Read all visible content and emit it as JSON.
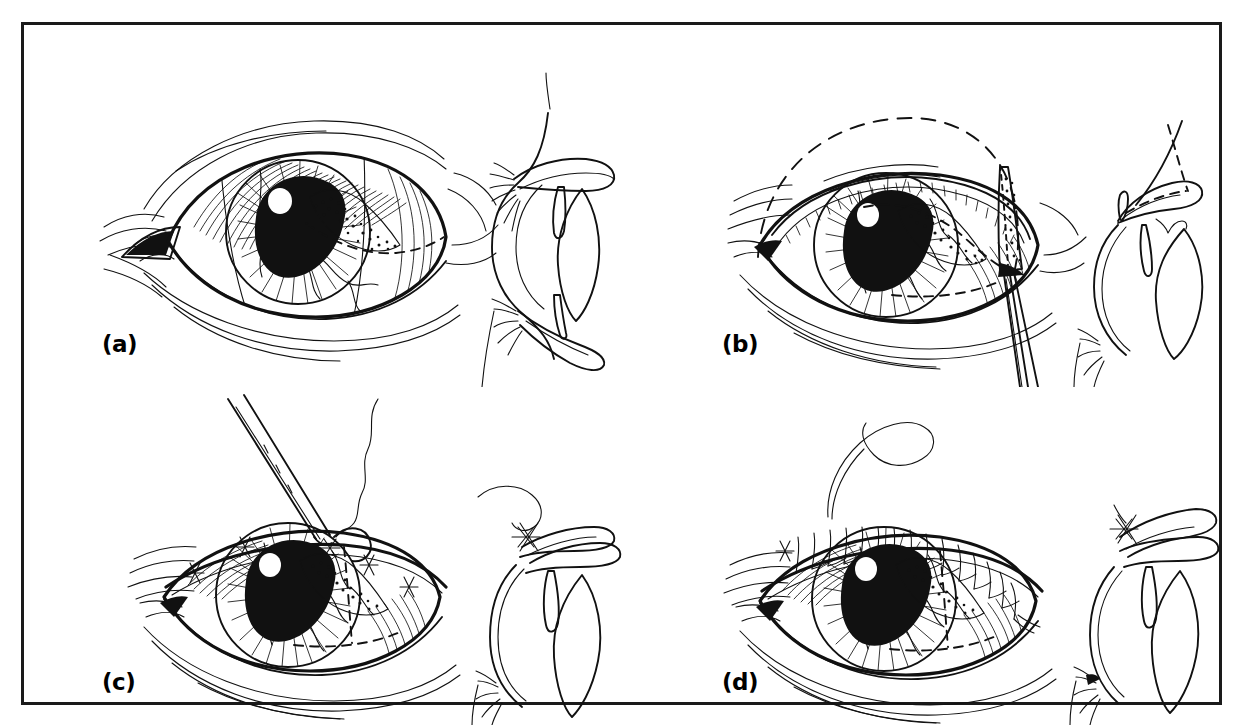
{
  "figure": {
    "kind": "surgical-technique-line-drawing",
    "background_color": "#ffffff",
    "ink_color": "#111111",
    "border_color": "#1a1a1a",
    "panel_count": 4,
    "panels": [
      {
        "id": "a",
        "label": "(a)",
        "views": [
          "frontal-eye-view",
          "sagittal-cross-section"
        ],
        "markings": [
          "dashed-incision-line"
        ]
      },
      {
        "id": "b",
        "label": "(b)",
        "views": [
          "frontal-eye-view",
          "sagittal-cross-section"
        ],
        "markings": [
          "dashed-incision-line",
          "dashed-reflected-lid-outline"
        ],
        "instruments": [
          "forceps"
        ]
      },
      {
        "id": "c",
        "label": "(c)",
        "views": [
          "frontal-eye-view",
          "sagittal-cross-section"
        ],
        "markings": [
          "dashed-incision-line"
        ],
        "instruments": [
          "needle-holder",
          "curved-needle",
          "suture-thread"
        ],
        "sutures": "interrupted"
      },
      {
        "id": "d",
        "label": "(d)",
        "views": [
          "frontal-eye-view",
          "sagittal-cross-section"
        ],
        "markings": [
          "dashed-incision-line"
        ],
        "instruments": [
          "suture-thread"
        ],
        "sutures": "running-continuous"
      }
    ]
  }
}
